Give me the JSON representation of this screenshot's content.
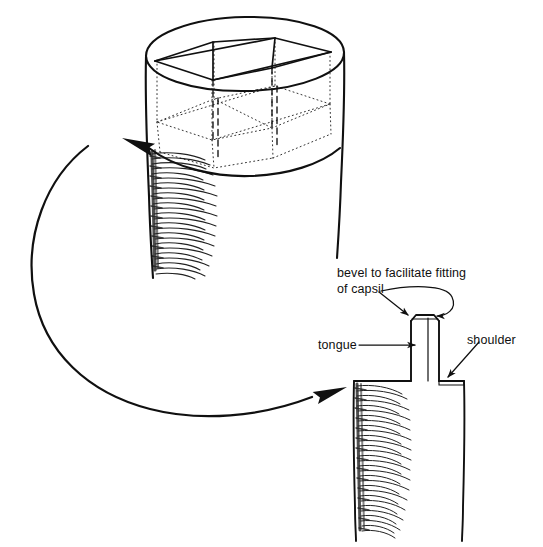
{
  "figure": {
    "background_color": "#ffffff",
    "ink_color": "#101010",
    "width": 543,
    "height": 547
  },
  "labels": {
    "bevel_line1": "bevel to facilitate fitting",
    "bevel_line2": "of capsil",
    "tongue": "tongue",
    "shoulder": "shoulder"
  },
  "objects": {
    "log_end": {
      "name": "round post end with inscribed rectangular tongue layout",
      "description": "cylinder seen in perspective with dashed and dotted construction lines marking the square tongue to be cut",
      "shading": "hand hatched bark texture on left side"
    },
    "finished_post": {
      "name": "finished post with tongue and shoulders",
      "description": "square post with a raised central tongue, beveled at the top, and flat shoulders either side",
      "shading": "hand hatched bark texture on left side"
    },
    "transform_arrow": {
      "name": "large curved process arrow",
      "description": "sweeping arrow from the marked log end round to the finished post",
      "heads": 2
    }
  },
  "leaders": {
    "bevel_left": "straight arrow to left bevel",
    "bevel_right": "curved arrow looping to right bevel",
    "tongue": "horizontal arrow to tongue face",
    "shoulder": "diagonal arrow to shoulder corner"
  }
}
